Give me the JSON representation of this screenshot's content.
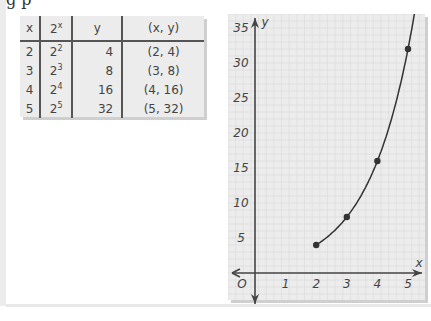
{
  "page": {
    "top_fragment": "g p"
  },
  "table": {
    "headers": [
      "x",
      "2^x",
      "y",
      "(x, y)"
    ],
    "rows": [
      {
        "x": "2",
        "base": "2",
        "exp": "2",
        "y": "4",
        "pair": "(2, 4)"
      },
      {
        "x": "3",
        "base": "2",
        "exp": "3",
        "y": "8",
        "pair": "(3, 8)"
      },
      {
        "x": "4",
        "base": "2",
        "exp": "4",
        "y": "16",
        "pair": "(4, 16)"
      },
      {
        "x": "5",
        "base": "2",
        "exp": "5",
        "y": "32",
        "pair": "(5, 32)"
      }
    ]
  },
  "chart_data": {
    "type": "line",
    "title": "",
    "xlabel": "x",
    "ylabel": "y",
    "x": [
      2,
      3,
      4,
      5
    ],
    "series": [
      {
        "name": "y = 2^x",
        "values": [
          4,
          8,
          16,
          32
        ]
      }
    ],
    "x_ticks": [
      "1",
      "2",
      "3",
      "4",
      "5"
    ],
    "y_ticks": [
      "5",
      "10",
      "15",
      "20",
      "25",
      "30",
      "35"
    ],
    "origin_label": "O",
    "xlim": [
      -0.8,
      5.5
    ],
    "ylim": [
      -3.5,
      37
    ],
    "grid": true,
    "legend": "none"
  }
}
